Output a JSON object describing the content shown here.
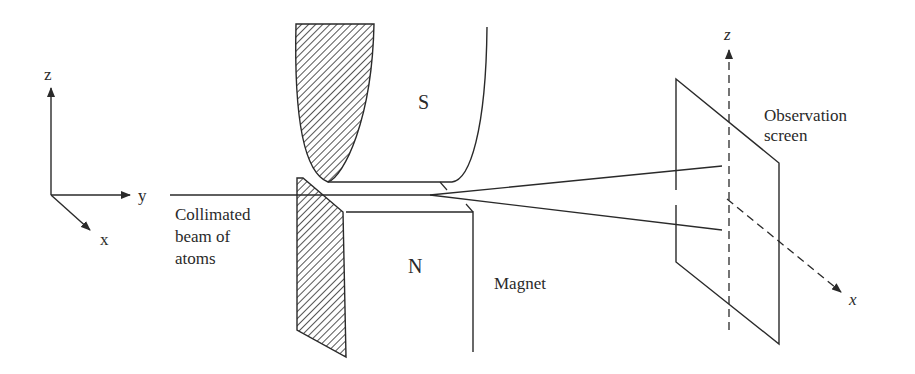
{
  "diagram": {
    "axes_left": {
      "z": "z",
      "y": "y",
      "x": "x"
    },
    "beam_label": [
      "Collimated",
      "beam of",
      "atoms"
    ],
    "magnet": {
      "south_pole": "S",
      "north_pole": "N",
      "label": "Magnet"
    },
    "screen": {
      "label": [
        "Observation",
        "screen"
      ],
      "axis_z": "z",
      "axis_x": "x"
    },
    "colors": {
      "ink": "#2a2a2a",
      "background": "#ffffff"
    }
  }
}
